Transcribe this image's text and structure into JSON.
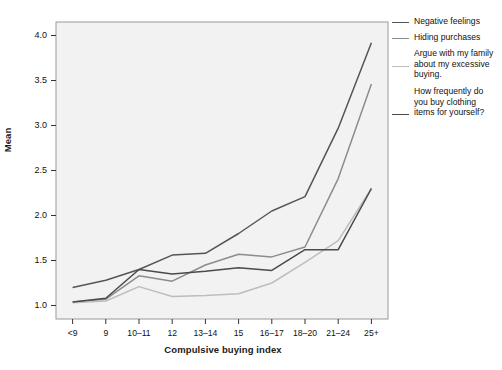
{
  "chart_data": {
    "type": "line",
    "title": "",
    "xlabel": "Compulsive buying index",
    "ylabel": "Mean",
    "categories": [
      "<9",
      "9",
      "10–11",
      "12",
      "13–14",
      "15",
      "16–17",
      "18–20",
      "21–24",
      "25+"
    ],
    "ylim": [
      0.85,
      4.15
    ],
    "yticks": [
      1.0,
      1.5,
      2.0,
      2.5,
      3.0,
      3.5,
      4.0
    ],
    "ytick_labels": [
      "1.0",
      "1.5",
      "2.0",
      "2.5",
      "3.0",
      "3.5",
      "4.0"
    ],
    "grid": false,
    "legend_position": "right",
    "series": [
      {
        "name": "Negative feelings",
        "color": "#555555",
        "values": [
          1.2,
          1.28,
          1.4,
          1.56,
          1.58,
          1.8,
          2.05,
          2.21,
          2.97,
          3.92
        ]
      },
      {
        "name": "Hiding purchases",
        "color": "#8c8c8c",
        "values": [
          1.04,
          1.07,
          1.33,
          1.27,
          1.45,
          1.57,
          1.54,
          1.65,
          2.41,
          3.46
        ]
      },
      {
        "name": "Argue with my family about my excessive buying.",
        "color": "#bdbdbd",
        "values": [
          1.03,
          1.05,
          1.21,
          1.1,
          1.11,
          1.13,
          1.25,
          1.48,
          1.72,
          2.3
        ]
      },
      {
        "name": "How frequently do you buy clothing items for yourself?",
        "color": "#4a4a4a",
        "values": [
          1.04,
          1.08,
          1.4,
          1.35,
          1.38,
          1.42,
          1.39,
          1.62,
          1.62,
          2.3
        ]
      }
    ]
  },
  "legend": {
    "entries": [
      {
        "label": "Negative feelings"
      },
      {
        "label": "Hiding purchases"
      },
      {
        "label": "Argue with my family about my excessive buying."
      },
      {
        "label": "How frequently do you buy clothing items for yourself?"
      }
    ]
  }
}
